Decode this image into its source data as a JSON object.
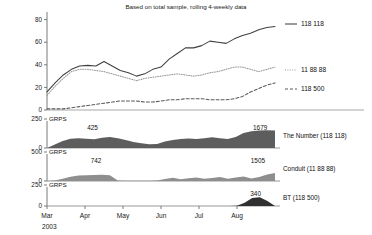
{
  "chart_data": {
    "type": "line",
    "title": "Based on total sample, rolling 4-weekly data",
    "xlabel": "",
    "ylabel": "",
    "ylim": [
      0,
      85
    ],
    "yticks": [
      0,
      20,
      40,
      60,
      80
    ],
    "ytick_labels": [
      "0",
      "20",
      "40",
      "60",
      "80"
    ],
    "xtick_labels": [
      "Mar",
      "Apr",
      "May",
      "Jun",
      "Jul",
      "Aug"
    ],
    "x_year": "2003",
    "grid": false,
    "legend_position": "right",
    "series": [
      {
        "name": "118 118",
        "style": "solid",
        "color": "#404040",
        "values": [
          16,
          24,
          31,
          36,
          39,
          39.5,
          39,
          43,
          39,
          35,
          33,
          30,
          32,
          36,
          38,
          45,
          50,
          55,
          55,
          57,
          61,
          60,
          59,
          63,
          66,
          68,
          71,
          73,
          74
        ]
      },
      {
        "name": "11 88 88",
        "style": "dotted",
        "color": "#9a9a9a",
        "values": [
          13,
          21,
          28,
          34,
          36,
          36,
          35,
          34,
          32,
          30,
          28,
          26,
          28,
          29,
          30,
          31,
          32,
          31,
          30,
          31,
          33,
          34,
          36,
          38,
          38,
          36,
          34,
          36,
          38
        ]
      },
      {
        "name": "118 500",
        "style": "dashed",
        "color": "#5a5a5a",
        "values": [
          1,
          1,
          1,
          2,
          3,
          4,
          5,
          6,
          7,
          8,
          8,
          8,
          7,
          7,
          8,
          9,
          9,
          10,
          10,
          10,
          9,
          9,
          9,
          10,
          12,
          16,
          19,
          22,
          24
        ]
      }
    ]
  },
  "panels": [
    {
      "axis_label": "GRPS",
      "name": "The Number (118 118)",
      "ylim": [
        0,
        250
      ],
      "yticks": [
        0,
        250
      ],
      "ytick_labels": [
        "0",
        "250"
      ],
      "annotations": [
        {
          "label": "425",
          "x_frac": 0.2
        },
        {
          "label": "1679",
          "x_frac": 0.935
        }
      ],
      "fill_color": "#5d5d5d",
      "values": [
        0,
        30,
        60,
        80,
        85,
        80,
        75,
        88,
        95,
        85,
        70,
        52,
        40,
        32,
        35,
        55,
        70,
        78,
        82,
        78,
        85,
        92,
        85,
        78,
        95,
        130,
        145,
        150,
        152,
        150
      ]
    },
    {
      "axis_label": "GRPS",
      "name": "Conduit (11 88 88)",
      "ylim": [
        0,
        500
      ],
      "yticks": [
        0,
        500
      ],
      "ytick_labels": [
        "0",
        "500"
      ],
      "annotations": [
        {
          "label": "742",
          "x_frac": 0.215
        },
        {
          "label": "1505",
          "x_frac": 0.925
        }
      ],
      "fill_color": "#8e8e8e",
      "values": [
        0,
        8,
        40,
        75,
        95,
        100,
        105,
        108,
        100,
        10,
        5,
        4,
        4,
        5,
        8,
        35,
        55,
        30,
        48,
        62,
        38,
        52,
        70,
        40,
        60,
        78,
        42,
        70,
        110,
        140
      ]
    },
    {
      "axis_label": "GRPS",
      "name": "BT (118 500)",
      "ylim": [
        0,
        250
      ],
      "yticks": [
        0,
        250
      ],
      "ytick_labels": [
        "0",
        "250"
      ],
      "annotations": [
        {
          "label": "340",
          "x_frac": 0.915
        }
      ],
      "fill_color": "#303030",
      "values": [
        0,
        0,
        0,
        0,
        0,
        0,
        0,
        0,
        0,
        0,
        0,
        0,
        0,
        0,
        0,
        0,
        0,
        0,
        0,
        0,
        0,
        0,
        0,
        0,
        0,
        2,
        40,
        95,
        105,
        60,
        0
      ]
    }
  ]
}
